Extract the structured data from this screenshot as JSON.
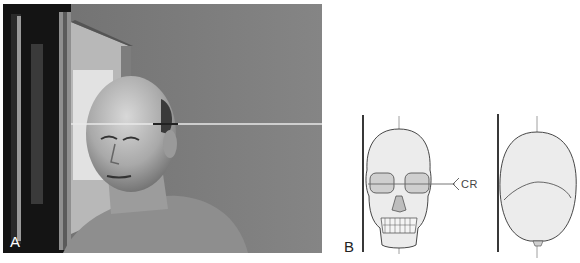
{
  "figure": {
    "panel_a": {
      "label": "A",
      "description": "Photograph of patient seated lateral to upright image receptor with central ray line at temple level"
    },
    "panel_b": {
      "label": "B",
      "front_view": {
        "description": "Frontal skull diagram with image receptor line and midsagittal line",
        "central_ray_label": "CR"
      },
      "top_view": {
        "description": "Superior skull diagram with image receptor line and midsagittal line"
      }
    },
    "colors": {
      "background": "#ffffff",
      "photo_wall": "#7a7a7a",
      "line": "#222222",
      "skull_fill": "#ececec",
      "skull_stroke": "#333333"
    }
  }
}
